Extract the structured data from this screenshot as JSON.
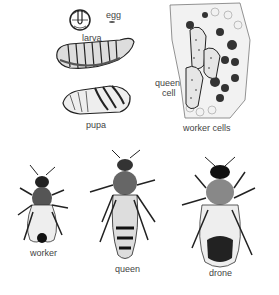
{
  "diagram": {
    "labels": {
      "egg": "egg",
      "larva": "larva",
      "pupa": "pupa",
      "queen_cell": "queen\ncell",
      "queen_cell_line1": "queen",
      "queen_cell_line2": "cell",
      "worker_cells": "worker cells",
      "worker": "worker",
      "queen": "queen",
      "drone": "drone"
    },
    "colors": {
      "ink": "#1a1a1a",
      "label": "#444444",
      "background": "#ffffff"
    }
  }
}
